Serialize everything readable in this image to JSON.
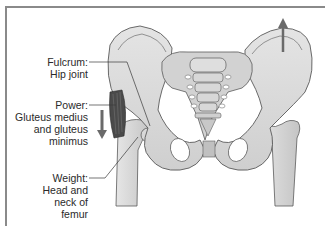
{
  "diagram": {
    "labels": [
      {
        "id": "fulcrum",
        "title": "Fulcrum:",
        "lines": [
          "Hip joint"
        ]
      },
      {
        "id": "power",
        "title": "Power:",
        "lines": [
          "Gluteus medius",
          "and gluteus",
          "minimus"
        ]
      },
      {
        "id": "weight",
        "title": "Weight:",
        "lines": [
          "Head and",
          "neck of",
          "femur"
        ]
      }
    ],
    "arrows": [
      {
        "id": "power-arrow",
        "direction": "down",
        "side": "left"
      },
      {
        "id": "lift-arrow",
        "direction": "up",
        "side": "right"
      }
    ],
    "colors": {
      "bone_fill": "#d6d6d6",
      "bone_light": "#ececec",
      "outline": "#5a5a5a",
      "muscle": "#4a4a4a",
      "arrow": "#6a6a6a",
      "text": "#2a2a2a",
      "frame": "#8a8a8a"
    }
  }
}
